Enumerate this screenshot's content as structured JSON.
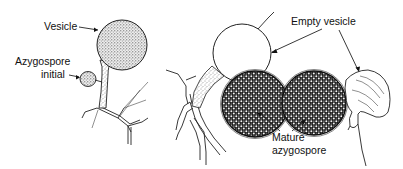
{
  "figure": {
    "panels": [
      {
        "id": "left",
        "description": "Hypha with vesicle and azygospore initial",
        "labels": {
          "vesicle": "Vesicle",
          "azygospore_initial_line1": "Azygospore",
          "azygospore_initial_line2": "initial"
        }
      },
      {
        "id": "middle",
        "description": "Empty vesicle above mature azygospore on hypha"
      },
      {
        "id": "right",
        "description": "Detached mature azygospore with collapsed empty vesicle"
      }
    ],
    "shared_labels": {
      "empty_vesicle": "Empty vesicle",
      "mature_azygospore_line1": "Mature",
      "mature_azygospore_line2": "azygospore"
    },
    "colors": {
      "ink": "#111111",
      "background": "#ffffff"
    }
  }
}
